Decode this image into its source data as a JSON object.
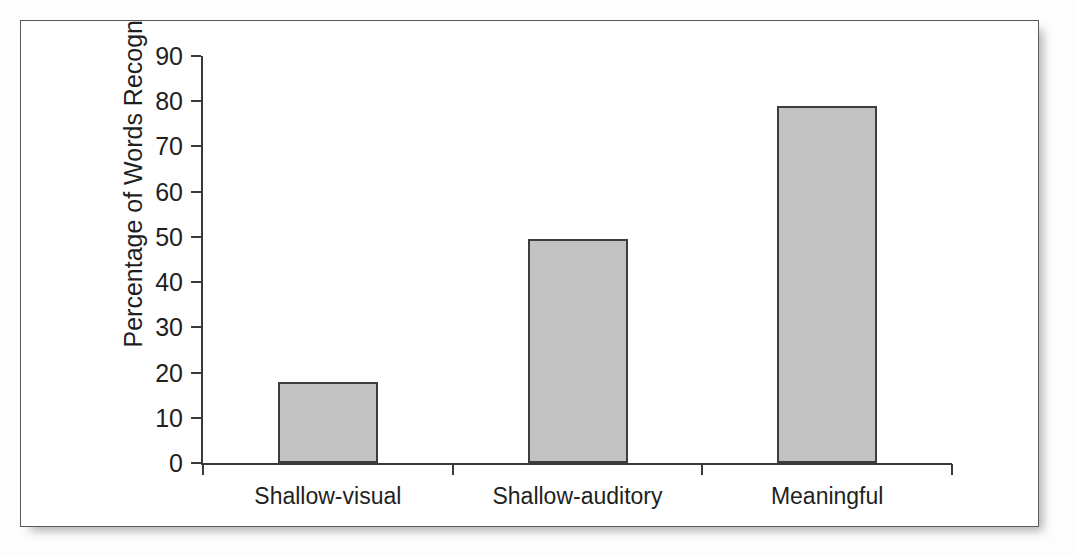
{
  "figure": {
    "panel_name": "bar-chart-figure",
    "frame_color": "#5a5a5a",
    "background_color": "#ffffff"
  },
  "chart_data": {
    "type": "bar",
    "title": "",
    "xlabel": "",
    "ylabel": "Percentage of Words Recognized",
    "categories": [
      "Shallow-visual",
      "Shallow-auditory",
      "Meaningful"
    ],
    "values": [
      18,
      49.5,
      79
    ],
    "ylim": [
      0,
      90
    ],
    "yticks": [
      0,
      10,
      20,
      30,
      40,
      50,
      60,
      70,
      80,
      90
    ],
    "ytick_labels": [
      "0",
      "10",
      "20",
      "30",
      "40",
      "50",
      "60",
      "70",
      "80",
      "90"
    ],
    "grid": false,
    "legend": null,
    "bar_fill_color": "#c2c2c2",
    "bar_edge_color": "#3d3d3d",
    "axis_color": "#3a3a3a"
  },
  "showthrough": {
    "note": "faint mirrored bleed-through text from the reverse page",
    "lines": [
      "s read and processing for meaning. Thus, in this case, deep processing had clear",
      "benefits, as is seen in Figure 4.",
      "MMEDIATE IMPROVEMENT TIP 4.1",
      "Apply the idea of processing to your own study strategies. Working on a paper abo",
      "the concept of personality, for instance, you might paraphrase, restate the matera",
      "your own words, or consider how the concepts apply to your own life. Such strate",
      "are examples of deep processing.",
      "Applications of Processing",
      "The idea that deep processing leads to better memory suggests that simply reading a"
    ]
  }
}
